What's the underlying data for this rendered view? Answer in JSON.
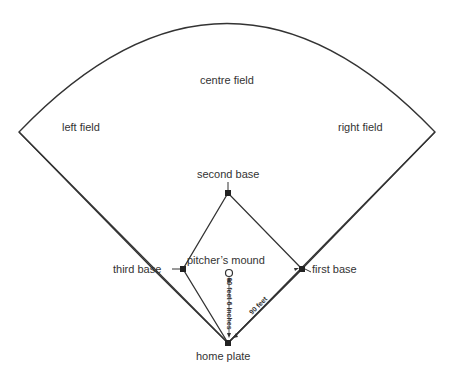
{
  "diagram": {
    "type": "baseball field layout",
    "labels": {
      "centre_field": "centre field",
      "left_field": "left field",
      "right_field": "right field",
      "second_base": "second base",
      "third_base": "third base",
      "first_base": "first base",
      "pitchers_mound": "pitcher’s mound",
      "home_plate": "home plate",
      "mound_distance": "60 feet 6 inches",
      "base_distance": "90 feet"
    },
    "colors": {
      "line": "#333333",
      "base": "#222222",
      "background": "#ffffff"
    }
  }
}
